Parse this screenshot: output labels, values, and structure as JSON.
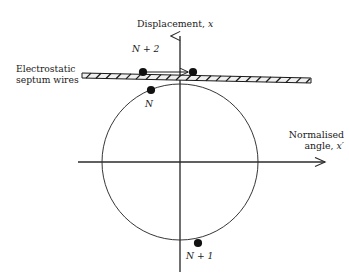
{
  "figure": {
    "kind": "phase-space-diagram",
    "axes": {
      "y_title_text": "Displacement,",
      "y_title_symbol": "x",
      "x_title_line1": "Normalised",
      "x_title_line2_text": "angle,",
      "x_title_symbol": "x′",
      "origin": {
        "x": 180,
        "y": 162
      },
      "y_axis": {
        "x": 180,
        "top": 33,
        "bottom": 272,
        "arrow": "up"
      },
      "x_axis": {
        "y": 162,
        "left": 78,
        "right": 330,
        "arrow": "right"
      }
    },
    "septum": {
      "label_line1": "Electrostatic",
      "label_line2": "septum wires",
      "band": {
        "x_start": 82,
        "x_end": 311,
        "y_start_top": 73,
        "y_end_top": 78,
        "thickness": 5,
        "hatch_count": 23
      }
    },
    "circle": {
      "center_x": 180,
      "center_y": 162,
      "radius": 78,
      "stroke": "#2b2b2b"
    },
    "particles": [
      {
        "id": "N",
        "label": "N",
        "label_math": "N",
        "x": 151,
        "y": 90,
        "r": 4.0,
        "label_x": 145,
        "label_y": 99
      },
      {
        "id": "N+1",
        "label": "N+1",
        "label_math": "N + 1",
        "x": 198,
        "y": 243,
        "r": 4.0,
        "label_x": 186,
        "label_y": 251
      },
      {
        "id": "N+2",
        "label": "N+2",
        "label_math": "N + 2",
        "x": 143,
        "y": 72,
        "r": 4.0,
        "label_x": 132,
        "label_y": 44
      },
      {
        "id": "N+2-kicked",
        "label": "",
        "label_math": "",
        "x": 193,
        "y": 72,
        "r": 4.0,
        "label_x": 0,
        "label_y": 0
      }
    ],
    "kick_arrow": {
      "from_x": 145,
      "from_y": 72,
      "to_x": 189,
      "to_y": 72,
      "description": "extraction kick from N+2 to septum gap"
    },
    "colors": {
      "ink": "#1a1a1a",
      "line": "#2b2b2b",
      "dot": "#111111",
      "septum_fill": "#e8e8e8",
      "background": "#ffffff"
    }
  }
}
